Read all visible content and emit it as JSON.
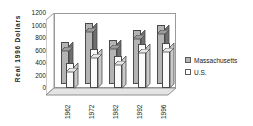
{
  "chart_data": {
    "type": "bar",
    "title": "",
    "xlabel": "",
    "ylabel": "Real  1996  Dollars",
    "categories": [
      "1962",
      "1972",
      "1982",
      "1992",
      "1996"
    ],
    "series": [
      {
        "name": "Massachusetts",
        "values": [
          750,
          1070,
          770,
          950,
          1050
        ],
        "color": "#b4b4b4"
      },
      {
        "name": "U.S.",
        "values": [
          450,
          680,
          570,
          770,
          790
        ],
        "color": "#ffffff"
      }
    ],
    "ylim": [
      0,
      1200
    ],
    "yticks": [
      0,
      200,
      400,
      600,
      800,
      1000,
      1200
    ],
    "ytick_labels": [
      "0",
      "200",
      "400",
      "600",
      "800",
      "1000",
      "1200"
    ],
    "grid": false,
    "legend_position": "right",
    "style": "3d-clustered-column"
  },
  "legend": {
    "entries": [
      {
        "label": "Massachusetts",
        "swatch": "massachusetts-swatch"
      },
      {
        "label": "U.S.",
        "swatch": "us-swatch"
      }
    ]
  }
}
